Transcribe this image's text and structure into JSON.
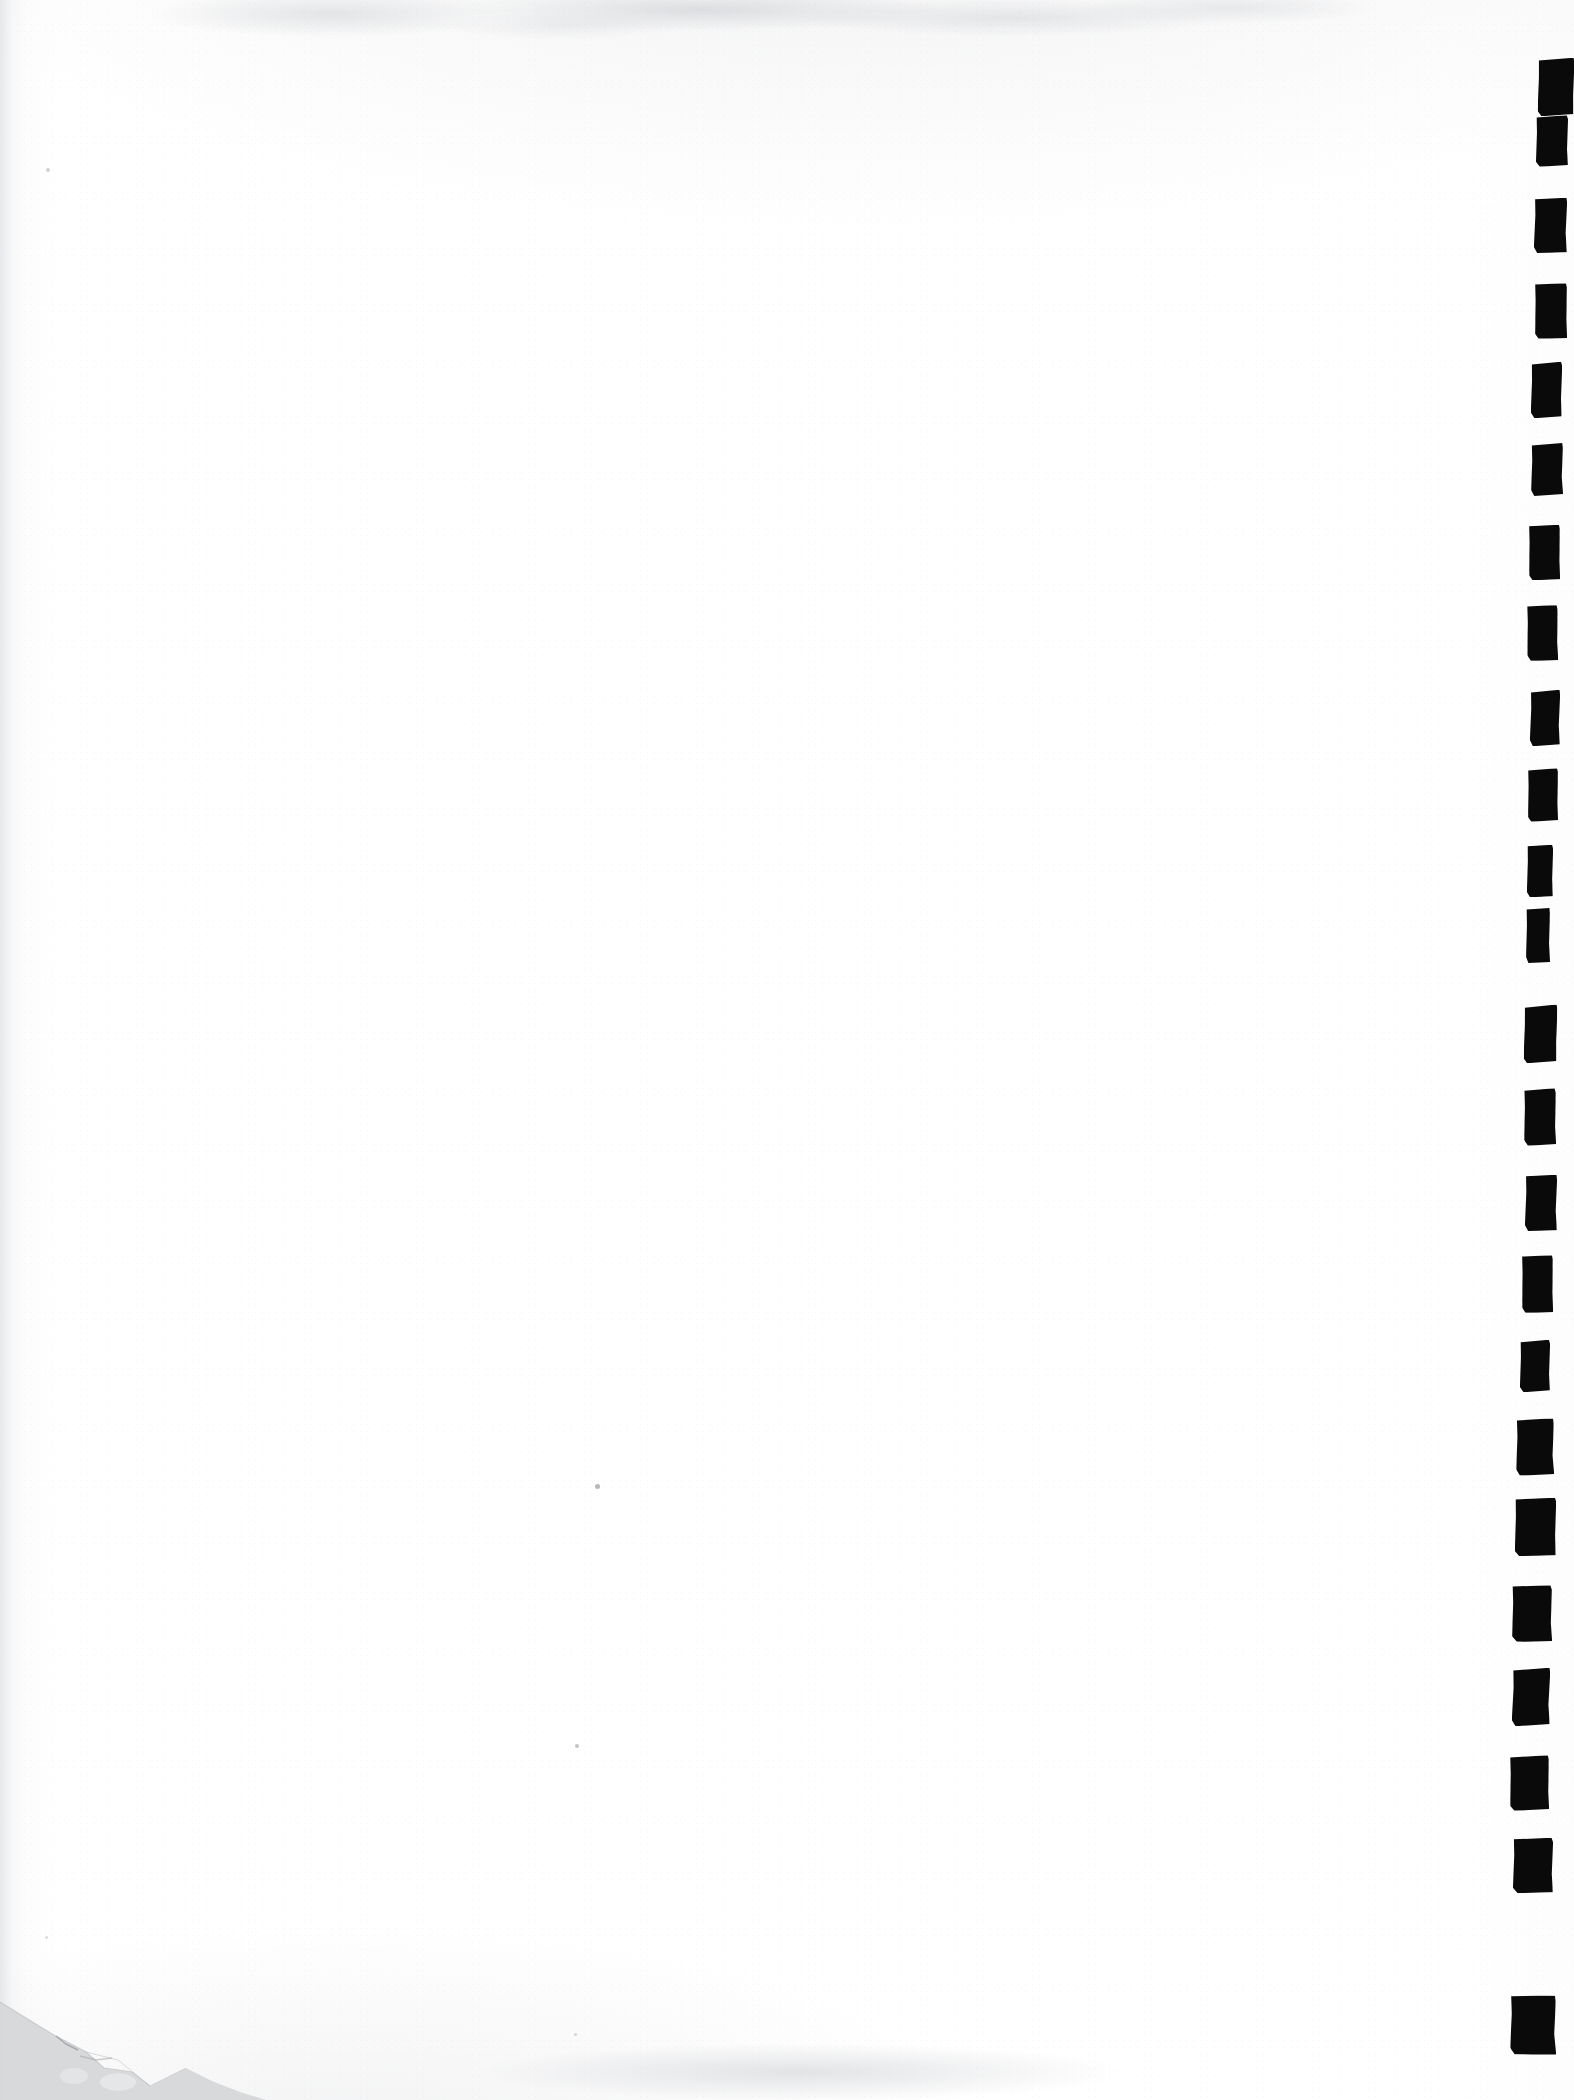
{
  "document": {
    "title": "Scanned blank page with right-edge index tab marks",
    "page_width": 1574,
    "page_height": 2100,
    "background_color": "#ffffff",
    "mark_color": "#0a0a0a",
    "paper_tone_color": "#fbfbfc",
    "shadow_color": "#d8d9db",
    "content_text": "",
    "visible_text_note": ""
  },
  "tab_marks": {
    "label": "Black rectangular index tab marks along right margin",
    "count": 19,
    "color": "#0a0a0a",
    "items": [
      {
        "id": 1,
        "x": 1538,
        "y": 58,
        "w": 36,
        "h": 58,
        "skew": -2.0,
        "rot": -1.0
      },
      {
        "id": 2,
        "x": 1536,
        "y": 115,
        "w": 32,
        "h": 52,
        "skew": 0.5,
        "rot": 0.6
      },
      {
        "id": 3,
        "x": 1534,
        "y": 198,
        "w": 33,
        "h": 55,
        "skew": -0.8,
        "rot": -0.5
      },
      {
        "id": 4,
        "x": 1535,
        "y": 283,
        "w": 32,
        "h": 56,
        "skew": 1.0,
        "rot": 0.8
      },
      {
        "id": 5,
        "x": 1531,
        "y": 362,
        "w": 31,
        "h": 56,
        "skew": -1.2,
        "rot": -0.7
      },
      {
        "id": 6,
        "x": 1531,
        "y": 443,
        "w": 32,
        "h": 53,
        "skew": 0.6,
        "rot": 0.4
      },
      {
        "id": 7,
        "x": 1529,
        "y": 525,
        "w": 31,
        "h": 55,
        "skew": -0.6,
        "rot": -0.9
      },
      {
        "id": 8,
        "x": 1527,
        "y": 605,
        "w": 31,
        "h": 56,
        "skew": 1.1,
        "rot": 0.5
      },
      {
        "id": 9,
        "x": 1530,
        "y": 690,
        "w": 30,
        "h": 56,
        "skew": -0.9,
        "rot": -0.6
      },
      {
        "id": 10,
        "x": 1528,
        "y": 768,
        "w": 30,
        "h": 54,
        "skew": 0.8,
        "rot": 0.7
      },
      {
        "id": 11,
        "x": 1527,
        "y": 845,
        "w": 26,
        "h": 52,
        "skew": -1.4,
        "rot": -1.1
      },
      {
        "id": 12,
        "x": 1526,
        "y": 908,
        "w": 24,
        "h": 55,
        "skew": 0.4,
        "rot": 0.3
      },
      {
        "id": 13,
        "x": 1524,
        "y": 1005,
        "w": 33,
        "h": 58,
        "skew": -2.4,
        "rot": -1.4
      },
      {
        "id": 14,
        "x": 1524,
        "y": 1088,
        "w": 32,
        "h": 58,
        "skew": 1.3,
        "rot": 1.0
      },
      {
        "id": 15,
        "x": 1525,
        "y": 1175,
        "w": 32,
        "h": 56,
        "skew": -0.7,
        "rot": -0.5
      },
      {
        "id": 16,
        "x": 1522,
        "y": 1255,
        "w": 31,
        "h": 58,
        "skew": 0.9,
        "rot": 0.6
      },
      {
        "id": 17,
        "x": 1520,
        "y": 1340,
        "w": 30,
        "h": 52,
        "skew": -1.0,
        "rot": -0.8
      },
      {
        "id": 18,
        "x": 1516,
        "y": 1418,
        "w": 38,
        "h": 58,
        "skew": 1.6,
        "rot": 1.2
      },
      {
        "id": 19,
        "x": 1515,
        "y": 1498,
        "w": 41,
        "h": 58,
        "skew": -1.1,
        "rot": -0.7
      },
      {
        "id": 20,
        "x": 1512,
        "y": 1585,
        "w": 40,
        "h": 57,
        "skew": 0.7,
        "rot": 0.5
      },
      {
        "id": 21,
        "x": 1512,
        "y": 1668,
        "w": 38,
        "h": 58,
        "skew": -1.5,
        "rot": -1.0
      },
      {
        "id": 22,
        "x": 1510,
        "y": 1755,
        "w": 39,
        "h": 56,
        "skew": 1.2,
        "rot": 0.9
      },
      {
        "id": 23,
        "x": 1513,
        "y": 1838,
        "w": 40,
        "h": 55,
        "skew": -0.8,
        "rot": -0.6
      },
      {
        "id": 24,
        "x": 1510,
        "y": 1995,
        "w": 46,
        "h": 60,
        "skew": 2.0,
        "rot": 1.6
      }
    ]
  },
  "specks": {
    "label": "Faint stray specks on page body",
    "items": [
      {
        "id": "speck-1",
        "x": 595,
        "y": 1484,
        "size": 5,
        "opacity": 0.55
      },
      {
        "id": "speck-2",
        "x": 575,
        "y": 1744,
        "size": 4,
        "opacity": 0.45
      },
      {
        "id": "speck-3",
        "x": 574,
        "y": 2033,
        "size": 3,
        "opacity": 0.3
      },
      {
        "id": "speck-4",
        "x": 46,
        "y": 168,
        "size": 4,
        "opacity": 0.35
      },
      {
        "id": "speck-5",
        "x": 45,
        "y": 1936,
        "size": 3,
        "opacity": 0.28
      }
    ]
  },
  "corner": {
    "label": "Torn and shadowed bottom-left corner",
    "shadow_color": "#d6d7d9",
    "position": "bottom-left"
  }
}
